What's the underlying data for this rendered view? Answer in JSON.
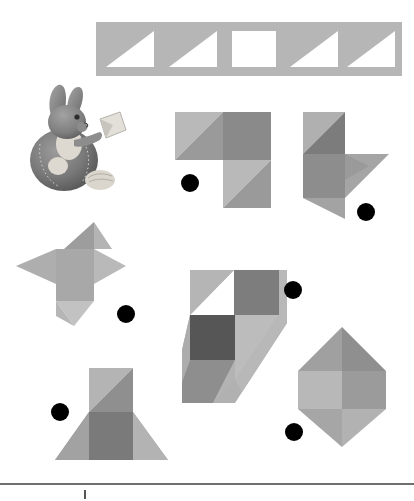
{
  "page": {
    "background_color": "#ffffff",
    "width": 414,
    "height": 501
  },
  "palette": {
    "banner_gray": "#b6b6b6",
    "light_gray": "#b9b9b9",
    "mid_gray": "#9a9a9a",
    "dark_gray": "#8a8a8a",
    "darkest_gray": "#565656",
    "white": "#ffffff",
    "dot_color": "#000000",
    "rule_color": "#6f6f6f"
  },
  "banner": {
    "name": "pattern-strip",
    "description": "Horizontal gray strip containing five square cells",
    "cell_count": 5,
    "cells": [
      {
        "index": 1,
        "type": "triangle",
        "fill": "#ffffff",
        "orientation": "right-angle-bottom-right"
      },
      {
        "index": 2,
        "type": "triangle",
        "fill": "#ffffff",
        "orientation": "right-angle-bottom-right"
      },
      {
        "index": 3,
        "type": "square",
        "fill": "#ffffff",
        "orientation": "none"
      },
      {
        "index": 4,
        "type": "triangle",
        "fill": "#ffffff",
        "orientation": "right-angle-bottom-right"
      },
      {
        "index": 5,
        "type": "triangle",
        "fill": "#ffffff",
        "orientation": "right-angle-bottom-right"
      }
    ]
  },
  "mascot": {
    "name": "bunny-holding-tangram",
    "description": "Grayscale plush rabbit seated, holding a tangram piece"
  },
  "figures": [
    {
      "id": "figure-1",
      "name": "tangram-figure-arrow-right",
      "description": "Three squares in L arrangement with diagonal splits",
      "dot": {
        "cx": 190,
        "cy": 183,
        "r": 9
      }
    },
    {
      "id": "figure-2",
      "name": "tangram-figure-flag",
      "description": "Vertical rectangle with triangular flag to the right",
      "dot": {
        "cx": 366,
        "cy": 212,
        "r": 9
      }
    },
    {
      "id": "figure-3",
      "name": "tangram-figure-star",
      "description": "Four-point pinwheel star",
      "dot": {
        "cx": 126,
        "cy": 314,
        "r": 9
      }
    },
    {
      "id": "figure-4",
      "name": "tangram-figure-diagonal-steps",
      "description": "Stepped diagonal band with checkered squares",
      "dot": {
        "cx": 293,
        "cy": 290,
        "r": 9
      }
    },
    {
      "id": "figure-5",
      "name": "tangram-figure-hexagon",
      "description": "Hexagonal gem split into four tones",
      "dot": {
        "cx": 294,
        "cy": 432,
        "r": 9
      }
    },
    {
      "id": "figure-6",
      "name": "tangram-figure-tree",
      "description": "Square on a wide triangular base",
      "dot": {
        "cx": 60,
        "cy": 412,
        "r": 9
      }
    }
  ],
  "footer": {
    "name": "page-rule",
    "has_rule": true,
    "has_tick": true
  }
}
